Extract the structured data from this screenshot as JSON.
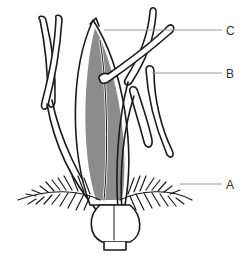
{
  "diagram": {
    "colors": {
      "outline": "#1a1a1a",
      "fill_gray": "#8c8c8c",
      "leader_line": "#9a9a9a",
      "label_text": "#333333",
      "background": "#ffffff"
    },
    "labels": [
      {
        "id": "C",
        "text": "C",
        "points_to": "lemma tip"
      },
      {
        "id": "B",
        "text": "B",
        "points_to": "stamen anther"
      },
      {
        "id": "A",
        "text": "A",
        "points_to": "feathery stigma"
      }
    ]
  }
}
